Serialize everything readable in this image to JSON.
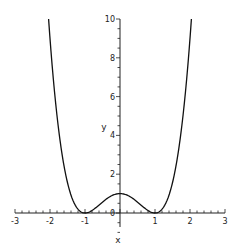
{
  "chart_data": {
    "type": "line",
    "title": "",
    "xlabel": "x",
    "ylabel": "y",
    "xlim": [
      -3,
      3
    ],
    "ylim": [
      0,
      10
    ],
    "x_ticks": [
      "-3",
      "-2",
      "-1",
      "0",
      "1",
      "2",
      "3"
    ],
    "y_ticks": [
      "0",
      "2",
      "4",
      "6",
      "8",
      "10"
    ],
    "grid": false,
    "legend": null,
    "series": [
      {
        "name": "(x^2-1)^2",
        "x": [
          -2.04,
          -2.0,
          -1.75,
          -1.5,
          -1.25,
          -1.0,
          -0.75,
          -0.5,
          -0.25,
          0.0,
          0.25,
          0.5,
          0.75,
          1.0,
          1.25,
          1.5,
          1.75,
          2.0,
          2.04
        ],
        "values": [
          10.0,
          9.0,
          4.25,
          1.56,
          0.32,
          0.0,
          0.19,
          0.56,
          0.88,
          1.0,
          0.88,
          0.56,
          0.19,
          0.0,
          0.32,
          1.56,
          4.25,
          9.0,
          10.0
        ]
      }
    ],
    "color": "#111111"
  },
  "axes": {
    "x_label": "x",
    "y_label": "y"
  }
}
